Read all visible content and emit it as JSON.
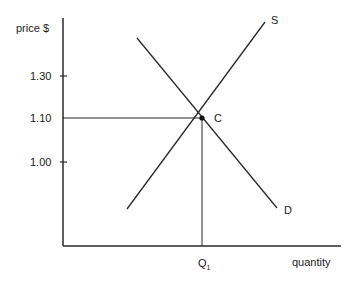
{
  "diagram": {
    "type": "supply-demand",
    "y_axis_label": "price $",
    "x_axis_label": "quantity",
    "y_ticks": [
      {
        "label": "1.30",
        "y": 76
      },
      {
        "label": "1.10",
        "y": 118
      },
      {
        "label": "1.00",
        "y": 162
      }
    ],
    "x_tick": {
      "label": "Q",
      "subscript": "1"
    },
    "curves": {
      "supply": {
        "label": "S"
      },
      "demand": {
        "label": "D"
      }
    },
    "equilibrium": {
      "label": "C",
      "price": "1.10",
      "quantity": "Q1"
    }
  },
  "colors": {
    "line": "#2a2a2a",
    "text": "#1a1a1a"
  }
}
